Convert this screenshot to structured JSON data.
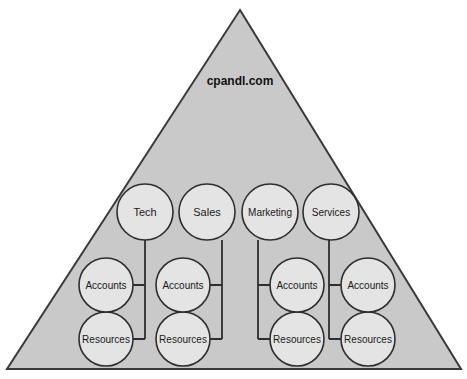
{
  "diagram": {
    "title": "cpandl.com",
    "shape": "pyramid",
    "colors": {
      "pyramid_fill": "#c9c9c9",
      "pyramid_stroke": "#3a3a3a",
      "circle_fill": "#e4e4e4",
      "circle_stroke": "#2e2e2e",
      "connector": "#2e2e2e",
      "text": "#1a1a1a",
      "background": "#ffffff"
    },
    "top_level_ous": [
      {
        "label": "Tech",
        "branch": "left"
      },
      {
        "label": "Sales",
        "branch": "left"
      },
      {
        "label": "Marketing",
        "branch": "right"
      },
      {
        "label": "Services",
        "branch": "right"
      }
    ],
    "accounts_ous": [
      {
        "label": "Accounts"
      },
      {
        "label": "Accounts"
      },
      {
        "label": "Accounts"
      },
      {
        "label": "Accounts"
      }
    ],
    "resources_ous": [
      {
        "label": "Resources"
      },
      {
        "label": "Resources"
      },
      {
        "label": "Resources"
      },
      {
        "label": "Resources"
      }
    ]
  }
}
